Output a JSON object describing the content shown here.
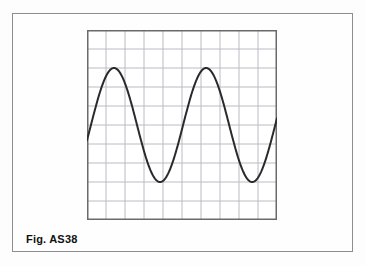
{
  "figure": {
    "caption": "Fig. AS38",
    "background_color": "#fdfdfd",
    "frame_color": "#8d8d8d"
  },
  "chart_data": {
    "type": "line",
    "title": "Fig. AS38",
    "subtitle": "",
    "xlabel": "",
    "ylabel": "",
    "grid": true,
    "legend": false,
    "grid_columns": 10,
    "grid_rows": 10,
    "grid_color": "#b8bcc4",
    "axis_border_color": "#6a6a6a",
    "line_color": "#2a2a2a",
    "line_width": 2,
    "xlim": [
      0,
      10
    ],
    "ylim": [
      0,
      10
    ],
    "waveform": {
      "shape": "sine",
      "cycles": 2,
      "amplitude_divisions": 3,
      "midline_division": 5,
      "period_divisions": 4.85,
      "phase_start_division": 5.05,
      "peaks": [
        {
          "x": 1.42,
          "y": 7.9
        },
        {
          "x": 6.26,
          "y": 7.9
        }
      ],
      "troughs": [
        {
          "x": 3.79,
          "y": 2.05
        },
        {
          "x": 8.63,
          "y": 2.05
        }
      ],
      "start_point": {
        "x": 0,
        "y": 5.05
      },
      "end_point": {
        "x": 10,
        "y": 4.95
      }
    },
    "x": [
      0.0,
      0.25,
      0.5,
      0.75,
      1.0,
      1.25,
      1.5,
      1.75,
      2.0,
      2.25,
      2.5,
      2.75,
      3.0,
      3.25,
      3.5,
      3.75,
      4.0,
      4.25,
      4.5,
      4.75,
      5.0,
      5.25,
      5.5,
      5.75,
      6.0,
      6.25,
      6.5,
      6.75,
      7.0,
      7.25,
      7.5,
      7.75,
      8.0,
      8.25,
      8.5,
      8.75,
      9.0,
      9.25,
      9.5,
      9.75,
      10.0
    ],
    "y": [
      5.05,
      6.17,
      7.15,
      7.77,
      7.93,
      7.6,
      6.83,
      5.74,
      4.5,
      3.31,
      2.38,
      2.04,
      2.06,
      2.47,
      3.28,
      4.39,
      5.48,
      6.58,
      7.4,
      7.87,
      7.91,
      7.5,
      6.73,
      5.63,
      4.39,
      3.23,
      2.34,
      2.05,
      2.08,
      2.53,
      3.36,
      4.47,
      5.52,
      6.63,
      7.45,
      7.88,
      7.9,
      7.46,
      6.67,
      5.55,
      4.95
    ]
  }
}
